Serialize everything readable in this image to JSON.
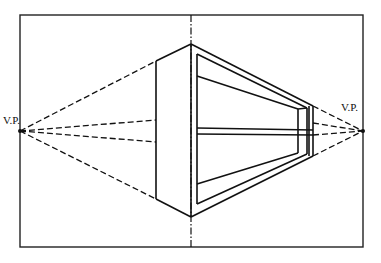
{
  "diagram": {
    "type": "two-point perspective construction",
    "labels": {
      "left_vp": "V.P.",
      "right_vp": "V.P."
    },
    "colors": {
      "ink": "#111111",
      "paper": "#ffffff"
    },
    "elements": {
      "frame": "picture plane border",
      "center_line": "vertical dashed center line",
      "box": "open-front box with one horizontal shelf",
      "left_vanishing_lines": 4,
      "right_vanishing_lines": 4
    }
  }
}
